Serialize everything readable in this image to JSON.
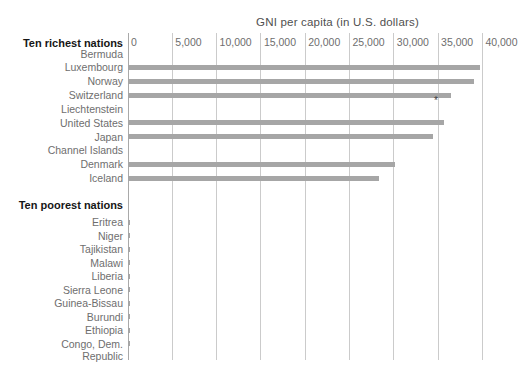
{
  "title": "GNI per capita (in U.S. dollars)",
  "footnote_mark": "*",
  "axis": {
    "ticks": [
      {
        "label": "0",
        "value": 0
      },
      {
        "label": "5,000",
        "value": 5000
      },
      {
        "label": "10,000",
        "value": 10000
      },
      {
        "label": "15,000",
        "value": 15000
      },
      {
        "label": "20,000",
        "value": 20000
      },
      {
        "label": "25,000",
        "value": 25000
      },
      {
        "label": "30,000",
        "value": 30000
      },
      {
        "label": "35,000",
        "value": 35000
      },
      {
        "label": "40,000",
        "value": 40000
      }
    ]
  },
  "groups": [
    {
      "header": "Ten richest nations",
      "rows": [
        {
          "label": "Bermuda",
          "value": null
        },
        {
          "label": "Luxembourg",
          "value": 39700
        },
        {
          "label": "Norway",
          "value": 39000
        },
        {
          "label": "Switzerland",
          "value": 36500
        },
        {
          "label": "Liechtenstein",
          "value": null
        },
        {
          "label": "United States",
          "value": 35700
        },
        {
          "label": "Japan",
          "value": 34400
        },
        {
          "label": "Channel Islands",
          "value": null
        },
        {
          "label": "Denmark",
          "value": 30100
        },
        {
          "label": "Iceland",
          "value": 28300
        }
      ]
    },
    {
      "header": "Ten poorest nations",
      "rows": [
        {
          "label": "Eritrea",
          "value": 200
        },
        {
          "label": "Niger",
          "value": 200
        },
        {
          "label": "Tajikistan",
          "value": 200
        },
        {
          "label": "Malawi",
          "value": 200
        },
        {
          "label": "Liberia",
          "value": 200
        },
        {
          "label": "Sierra Leone",
          "value": 200
        },
        {
          "label": "Guinea-Bissau",
          "value": 200
        },
        {
          "label": "Burundi",
          "value": 200
        },
        {
          "label": "Ethiopia",
          "value": 200
        },
        {
          "label": "Congo, Dem.\nRepublic",
          "value": 200
        }
      ]
    }
  ],
  "colors": {
    "bar": "#a6a6a6",
    "gridline": "#cbcbcb",
    "axis_line": "#a9a9a9",
    "label_text": "#6e6e6e",
    "header_text": "#161616",
    "title_text": "#4f4f4f"
  },
  "chart_data": {
    "type": "bar",
    "orientation": "horizontal",
    "title": "GNI per capita (in U.S. dollars)",
    "xlabel": "GNI per capita (in U.S. dollars)",
    "ylabel": "",
    "xlim": [
      0,
      40000
    ],
    "xticks": [
      0,
      5000,
      10000,
      15000,
      20000,
      25000,
      30000,
      35000,
      40000
    ],
    "grid": true,
    "legend": false,
    "series": [
      {
        "name": "Ten richest nations",
        "categories": [
          "Bermuda",
          "Luxembourg",
          "Norway",
          "Switzerland",
          "Liechtenstein",
          "United States",
          "Japan",
          "Channel Islands",
          "Denmark",
          "Iceland"
        ],
        "values": [
          null,
          39700,
          39000,
          36500,
          null,
          35700,
          34400,
          null,
          30100,
          28300
        ]
      },
      {
        "name": "Ten poorest nations",
        "categories": [
          "Eritrea",
          "Niger",
          "Tajikistan",
          "Malawi",
          "Liberia",
          "Sierra Leone",
          "Guinea-Bissau",
          "Burundi",
          "Ethiopia",
          "Congo, Dem. Republic"
        ],
        "values": [
          200,
          200,
          200,
          200,
          200,
          200,
          200,
          200,
          200,
          200
        ]
      }
    ],
    "annotations": [
      {
        "text": "*",
        "near": "below end of Switzerland bar, at Liechtenstein row (~34,500)"
      }
    ]
  }
}
